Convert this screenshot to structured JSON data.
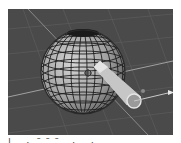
{
  "viewport": {
    "label": "3D viewport",
    "background": "#4a4a4a",
    "grid_color": "#5c5c5c",
    "axis_color": "#9a9a9a"
  },
  "objects": {
    "sphere": {
      "name": "UV sphere",
      "fill": "#a8a8a8",
      "wire": "#1e1e1e"
    },
    "cone": {
      "name": "cone",
      "fill": "#c8c8c8"
    },
    "transform_arrow": {
      "name": "x-axis arrow",
      "color": "#d8d8d8"
    }
  },
  "caption": {
    "text": "| ·  ̄  ̄   ̄ ·  ·"
  }
}
